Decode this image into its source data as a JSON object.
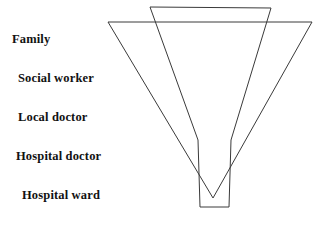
{
  "figure": {
    "background_color": "#ffffff",
    "line_color": "#3a3a3a",
    "text_color": "#121212"
  },
  "labels": [
    {
      "text": "Family",
      "x": 12,
      "y": 33
    },
    {
      "text": "Social worker",
      "x": 18,
      "y": 72
    },
    {
      "text": "Local doctor",
      "x": 18,
      "y": 111
    },
    {
      "text": "Hospital doctor",
      "x": 16,
      "y": 150
    },
    {
      "text": "Hospital ward",
      "x": 22,
      "y": 189
    }
  ],
  "shapes": {
    "outer_funnel": {
      "name": "outer-funnel",
      "points": "108,22 312,22 213,198",
      "stroke": "#3a3a3a",
      "stroke_width": 1,
      "fill": "none"
    },
    "inner_funnel": {
      "name": "inner-funnel",
      "points": "150,7 271,8 231,140 229,207 200,207 198,140",
      "stroke": "#3a3a3a",
      "stroke_width": 1,
      "fill": "none"
    }
  }
}
